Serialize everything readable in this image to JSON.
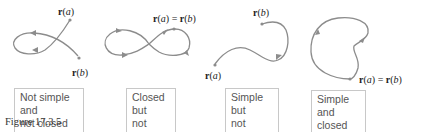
{
  "figure": {
    "caption": "Figure 17.3.5",
    "curve_color": "#8c8c8c",
    "panels": [
      {
        "id": "not-simple-not-closed",
        "description": "Not simple and not closed",
        "box_line1": "Not simple and",
        "box_line2": "not closed",
        "start_label": "r(a)",
        "end_label": "r(b)"
      },
      {
        "id": "closed-not-simple",
        "description": "Closed but not simple",
        "box_line1": "Closed but",
        "box_line2": "not simple",
        "endpoint_label": "r(a) = r(b)"
      },
      {
        "id": "simple-not-closed",
        "description": "Simple but not closed",
        "box_line1": "Simple but",
        "box_line2": "not closed",
        "start_label": "r(a)",
        "end_label": "r(b)"
      },
      {
        "id": "simple-closed",
        "description": "Simple and closed",
        "box_line1": "Simple and",
        "box_line2": "closed",
        "endpoint_label": "r(a) = r(b)"
      }
    ]
  }
}
